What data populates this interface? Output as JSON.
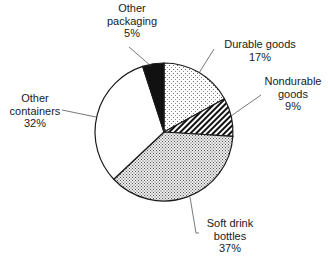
{
  "chart_data": {
    "type": "pie",
    "title": "",
    "start_angle_deg": 0,
    "direction": "clockwise",
    "slices": [
      {
        "label": "Durable goods",
        "value": 17,
        "pattern": "sparse-dots",
        "label_lines": [
          "Durable goods",
          "17%"
        ]
      },
      {
        "label": "Nondurable goods",
        "value": 9,
        "pattern": "diagonal-hatch",
        "label_lines": [
          "Nondurable",
          "goods",
          "9%"
        ]
      },
      {
        "label": "Soft drink bottles",
        "value": 37,
        "pattern": "dense-dots",
        "label_lines": [
          "Soft drink",
          "bottles",
          "37%"
        ]
      },
      {
        "label": "Other containers",
        "value": 32,
        "pattern": "white",
        "label_lines": [
          "Other",
          "containers",
          "32%"
        ]
      },
      {
        "label": "Other packaging",
        "value": 5,
        "pattern": "solid-black",
        "label_lines": [
          "Other",
          "packaging",
          "5%"
        ]
      }
    ],
    "legend": "none (direct labels with leader lines)"
  },
  "colors": {
    "background": "#ffffff",
    "stroke": "#1a1a1a",
    "leader": "#555555",
    "black_fill": "#111111"
  }
}
